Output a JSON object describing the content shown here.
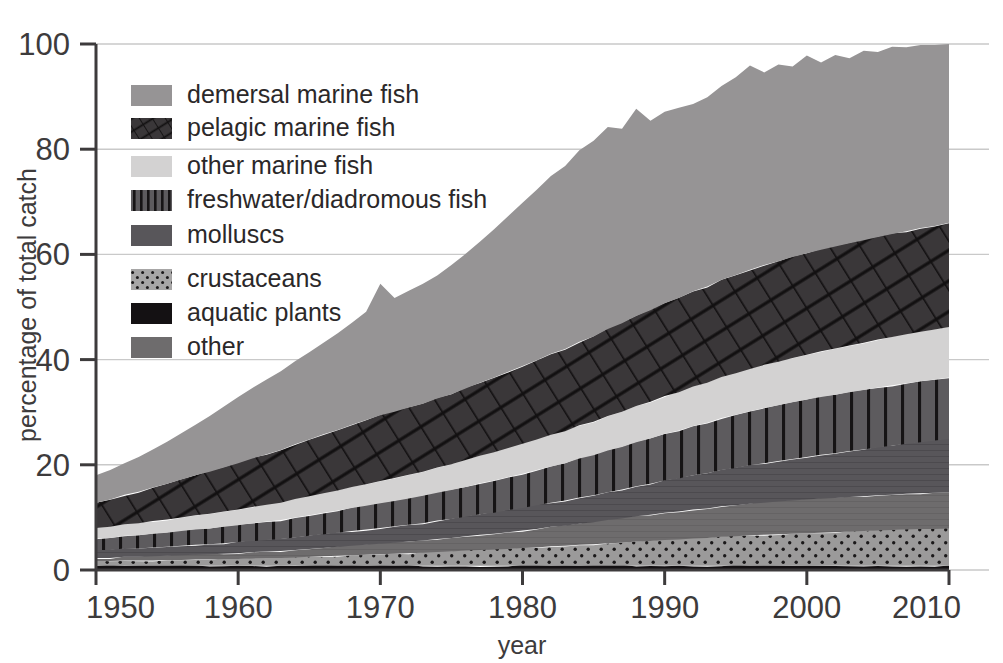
{
  "chart_data": {
    "type": "area",
    "title": "",
    "subtitle": "",
    "xlabel": "year",
    "ylabel": "percentage of total catch",
    "xlim": [
      1950,
      2010
    ],
    "ylim": [
      0,
      100
    ],
    "xticks": [
      1950,
      1960,
      1970,
      1980,
      1990,
      2000,
      2010
    ],
    "xtick_labels": [
      "1950",
      "1960",
      "1970",
      "1980",
      "1990",
      "2000",
      "2010"
    ],
    "yticks": [
      0,
      20,
      40,
      60,
      80,
      100
    ],
    "ytick_labels": [
      "0",
      "20",
      "40",
      "60",
      "80",
      "100"
    ],
    "grid": true,
    "grid_axis": "y",
    "stacked": true,
    "legend_position": "upper-left-inside",
    "x": [
      1950,
      1951,
      1952,
      1953,
      1954,
      1955,
      1956,
      1957,
      1958,
      1959,
      1960,
      1961,
      1962,
      1963,
      1964,
      1965,
      1966,
      1967,
      1968,
      1969,
      1970,
      1971,
      1972,
      1973,
      1974,
      1975,
      1976,
      1977,
      1978,
      1979,
      1980,
      1981,
      1982,
      1983,
      1984,
      1985,
      1986,
      1987,
      1988,
      1989,
      1990,
      1991,
      1992,
      1993,
      1994,
      1995,
      1996,
      1997,
      1998,
      1999,
      2000,
      2001,
      2002,
      2003,
      2004,
      2005,
      2006,
      2007,
      2008,
      2009,
      2010
    ],
    "series": [
      {
        "name": "aquatic plants",
        "legend_order": 7,
        "stack_order": 1,
        "color": "#141113",
        "pattern": "solid-dark",
        "values": [
          0.8,
          0.8,
          0.8,
          0.8,
          0.8,
          0.8,
          0.8,
          0.8,
          0.8,
          0.8,
          0.8,
          0.8,
          0.8,
          0.8,
          0.8,
          0.8,
          0.8,
          0.8,
          0.8,
          0.8,
          0.8,
          0.8,
          0.8,
          0.8,
          0.8,
          0.8,
          0.8,
          0.8,
          0.8,
          0.8,
          0.8,
          0.8,
          0.8,
          0.8,
          0.8,
          0.8,
          0.8,
          0.8,
          0.8,
          0.8,
          0.8,
          0.8,
          0.8,
          0.8,
          0.8,
          0.8,
          0.8,
          0.8,
          0.8,
          0.8,
          0.8,
          0.8,
          0.8,
          0.8,
          0.8,
          0.8,
          0.8,
          0.8,
          0.8,
          0.8,
          0.8
        ]
      },
      {
        "name": "crustaceans",
        "legend_order": 6,
        "stack_order": 2,
        "color": "#9b9a9a",
        "pattern": "dots",
        "values": [
          0.9,
          0.9,
          1.0,
          1.0,
          1.0,
          1.1,
          1.1,
          1.2,
          1.2,
          1.3,
          1.3,
          1.4,
          1.5,
          1.5,
          1.6,
          1.7,
          1.8,
          1.9,
          2.0,
          2.1,
          2.2,
          2.3,
          2.4,
          2.5,
          2.6,
          2.7,
          2.9,
          3.0,
          3.1,
          3.2,
          3.4,
          3.5,
          3.7,
          3.8,
          4.0,
          4.1,
          4.3,
          4.4,
          4.6,
          4.7,
          4.9,
          5.0,
          5.2,
          5.3,
          5.5,
          5.6,
          5.8,
          5.9,
          6.0,
          6.1,
          6.2,
          6.3,
          6.4,
          6.5,
          6.6,
          6.7,
          6.8,
          6.9,
          7.0,
          7.0,
          7.1
        ]
      },
      {
        "name": "other",
        "legend_order": 8,
        "stack_order": 3,
        "color": "#6e6c6d",
        "pattern": "solid-mid",
        "values": [
          0.6,
          0.6,
          0.7,
          0.7,
          0.8,
          0.8,
          0.9,
          0.9,
          1.0,
          1.0,
          1.1,
          1.2,
          1.2,
          1.3,
          1.4,
          1.5,
          1.6,
          1.7,
          1.8,
          1.9,
          2.0,
          2.1,
          2.2,
          2.3,
          2.5,
          2.6,
          2.7,
          2.9,
          3.0,
          3.2,
          3.3,
          3.5,
          3.7,
          3.8,
          4.0,
          4.2,
          4.4,
          4.6,
          4.8,
          5.0,
          5.2,
          5.3,
          5.5,
          5.6,
          5.8,
          5.9,
          6.0,
          6.1,
          6.2,
          6.3,
          6.4,
          6.5,
          6.5,
          6.6,
          6.6,
          6.7,
          6.7,
          6.8,
          6.8,
          6.9,
          6.9
        ]
      },
      {
        "name": "molluscs",
        "legend_order": 5,
        "stack_order": 4,
        "color": "#58565a",
        "pattern": "solid-dark-grey",
        "values": [
          1.5,
          1.5,
          1.6,
          1.6,
          1.7,
          1.7,
          1.8,
          1.9,
          1.9,
          2.0,
          2.1,
          2.1,
          2.2,
          2.3,
          2.4,
          2.5,
          2.6,
          2.7,
          2.8,
          2.9,
          3.0,
          3.1,
          3.2,
          3.3,
          3.5,
          3.6,
          3.7,
          3.9,
          4.0,
          4.2,
          4.3,
          4.5,
          4.6,
          4.8,
          5.0,
          5.1,
          5.3,
          5.5,
          5.7,
          5.9,
          6.1,
          6.3,
          6.5,
          6.7,
          6.9,
          7.1,
          7.3,
          7.5,
          7.7,
          7.9,
          8.1,
          8.3,
          8.5,
          8.7,
          8.9,
          9.1,
          9.3,
          9.5,
          9.7,
          9.9,
          10.1
        ]
      },
      {
        "name": "freshwater/diadromous fish",
        "legend_order": 4,
        "stack_order": 5,
        "color": "#5d5b5e",
        "pattern": "vertical-stripes",
        "values": [
          2.2,
          2.3,
          2.4,
          2.5,
          2.6,
          2.7,
          2.8,
          2.9,
          3.0,
          3.1,
          3.2,
          3.4,
          3.5,
          3.6,
          3.8,
          3.9,
          4.1,
          4.2,
          4.4,
          4.5,
          4.7,
          4.8,
          5.0,
          5.2,
          5.3,
          5.5,
          5.7,
          5.9,
          6.1,
          6.3,
          6.5,
          6.7,
          6.9,
          7.1,
          7.4,
          7.6,
          7.9,
          8.1,
          8.4,
          8.6,
          8.9,
          9.1,
          9.4,
          9.6,
          9.9,
          10.1,
          10.3,
          10.5,
          10.6,
          10.8,
          10.9,
          11.0,
          11.1,
          11.2,
          11.3,
          11.4,
          11.5,
          11.5,
          11.6,
          11.6,
          11.7
        ]
      },
      {
        "name": "other marine fish",
        "legend_order": 3,
        "stack_order": 6,
        "color": "#d3d2d2",
        "pattern": "solid-light",
        "values": [
          2.0,
          2.1,
          2.2,
          2.3,
          2.4,
          2.5,
          2.6,
          2.7,
          2.8,
          2.9,
          3.0,
          3.1,
          3.2,
          3.3,
          3.5,
          3.6,
          3.7,
          3.8,
          4.0,
          4.1,
          4.2,
          4.4,
          4.5,
          4.6,
          4.8,
          4.9,
          5.1,
          5.2,
          5.4,
          5.5,
          5.7,
          5.8,
          6.0,
          6.1,
          6.3,
          6.4,
          6.6,
          6.7,
          6.9,
          7.0,
          7.2,
          7.3,
          7.5,
          7.6,
          7.8,
          7.9,
          8.0,
          8.2,
          8.3,
          8.4,
          8.5,
          8.7,
          8.8,
          8.9,
          9.0,
          9.1,
          9.2,
          9.3,
          9.4,
          9.5,
          9.6
        ]
      },
      {
        "name": "pelagic marine fish",
        "legend_order": 2,
        "stack_order": 7,
        "color": "#3a3739",
        "pattern": "diagonal-hatch",
        "values": [
          4.8,
          5.2,
          5.6,
          6.0,
          6.4,
          6.8,
          7.2,
          7.6,
          8.0,
          8.4,
          8.8,
          9.2,
          9.6,
          10.0,
          10.4,
          10.8,
          11.2,
          11.5,
          11.8,
          12.2,
          12.5,
          12.6,
          12.8,
          12.9,
          13.1,
          13.3,
          13.6,
          13.9,
          14.2,
          14.5,
          14.8,
          15.1,
          15.4,
          15.6,
          15.9,
          16.2,
          16.5,
          16.8,
          17.1,
          17.4,
          17.6,
          17.9,
          18.1,
          18.3,
          18.5,
          18.7,
          18.9,
          19.0,
          19.1,
          19.2,
          19.3,
          19.3,
          19.4,
          19.4,
          19.5,
          19.5,
          19.6,
          19.6,
          19.7,
          19.7,
          19.8
        ]
      },
      {
        "name": "demersal marine fish",
        "legend_order": 1,
        "stack_order": 8,
        "color": "#969495",
        "pattern": "solid-grey",
        "values": [
          5.2,
          5.6,
          6.0,
          6.6,
          7.2,
          8.0,
          8.8,
          9.6,
          10.6,
          11.6,
          12.6,
          13.4,
          14.2,
          15.0,
          15.8,
          16.6,
          17.4,
          18.4,
          19.4,
          20.6,
          25.0,
          21.6,
          22.2,
          22.8,
          23.4,
          24.6,
          25.6,
          26.8,
          28.2,
          29.6,
          31.0,
          32.4,
          33.8,
          34.8,
          36.4,
          37.2,
          38.4,
          37.0,
          39.4,
          36.0,
          36.4,
          36.2,
          35.6,
          36.0,
          36.8,
          37.6,
          38.8,
          36.6,
          37.4,
          36.2,
          37.6,
          35.6,
          36.4,
          35.2,
          36.0,
          35.2,
          35.6,
          35.0,
          34.8,
          34.4,
          34.0
        ]
      }
    ],
    "totals_note": "stacked percentages of total catch",
    "totals": [
      18.0,
      19.0,
      20.3,
      21.5,
      22.9,
      24.4,
      26.0,
      27.6,
      29.3,
      31.1,
      32.9,
      34.5,
      36.2,
      37.8,
      39.7,
      41.3,
      43.2,
      44.8,
      46.6,
      48.6,
      53.0,
      49.3,
      50.5,
      51.3,
      52.6,
      54.4,
      56.4,
      58.5,
      60.8,
      62.8,
      64.8,
      66.8,
      68.8,
      70.1,
      72.3,
      73.6,
      75.6,
      74.4,
      77.3,
      74.1,
      74.9,
      75.0,
      74.7,
      75.4,
      76.7,
      77.8,
      79.4,
      77.1,
      78.5,
      77.6,
      79.3,
      77.5,
      78.9,
      77.7,
      78.7,
      78.2,
      78.7,
      78.4,
      78.7,
      78.5,
      78.7
    ]
  },
  "axis": {
    "y_title": "percentage of total catch",
    "x_title": "year",
    "y_labels": [
      "100",
      "80",
      "60",
      "40",
      "20",
      "0"
    ],
    "x_labels": [
      "1950",
      "1960",
      "1970",
      "1980",
      "1990",
      "2000",
      "2010"
    ]
  },
  "legend": {
    "items": [
      {
        "label": "demersal marine fish",
        "swatch": "solid-grey"
      },
      {
        "label": "pelagic marine fish",
        "swatch": "diagonal-hatch"
      },
      {
        "label": "other marine fish",
        "swatch": "solid-light"
      },
      {
        "label": "freshwater/diadromous fish",
        "swatch": "vertical-stripes"
      },
      {
        "label": "molluscs",
        "swatch": "solid-dark-grey"
      },
      {
        "label": "crustaceans",
        "swatch": "dots"
      },
      {
        "label": "aquatic plants",
        "swatch": "solid-dark"
      },
      {
        "label": "other",
        "swatch": "solid-mid"
      }
    ]
  },
  "colors": {
    "demersal": "#969495",
    "pelagic": "#3a3739",
    "other_marine": "#d3d2d2",
    "freshwater": "#5d5b5e",
    "molluscs": "#58565a",
    "crustaceans": "#9b9a9a",
    "aquatic_plants": "#141113",
    "other": "#6e6c6d",
    "axis": "#3d3b3c",
    "grid": "#c9c9c9",
    "background": "#ffffff"
  }
}
